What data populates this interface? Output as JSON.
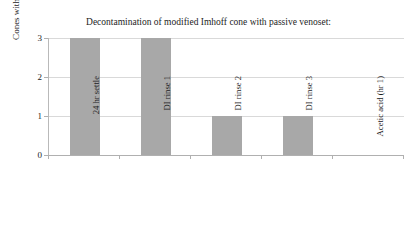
{
  "chart_data": {
    "type": "bar",
    "title": "Decontamination of modified Imhoff cone with passive venoset: PCR results",
    "title_lines": [
      "Decontamination of modified Imhoff cone with passive venoset:",
      "PCR results"
    ],
    "xlabel": "",
    "ylabel": "Cones with positive assays",
    "categories": [
      "24 hr settle",
      "DI rinse 1",
      "DI rinse 2",
      "DI rinse 3",
      "Acetic acid (hr 1)"
    ],
    "values": [
      3,
      3,
      1,
      1,
      0
    ],
    "ylim": [
      0,
      3
    ],
    "y_ticks": [
      0,
      1,
      2,
      3
    ],
    "y_tick_labels": [
      "0",
      "1",
      "2",
      "3"
    ],
    "grid": true,
    "grid_axis": "y",
    "legend": false,
    "legend_position": "none",
    "bar_color": "#a8a8a8",
    "gridline_color": "#d9d9d9",
    "axis_color": "#b0b0b0",
    "plot_background": "#ffffff",
    "figure_background": "#ffffff"
  }
}
